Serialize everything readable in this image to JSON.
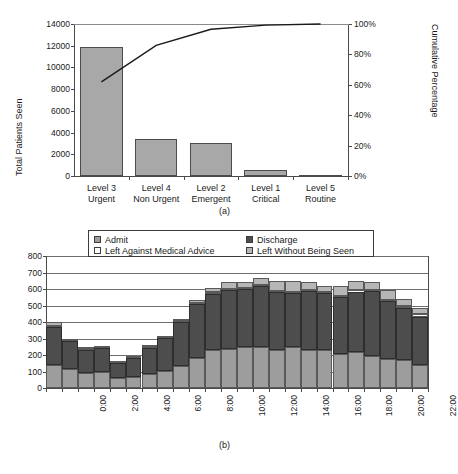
{
  "figure_a": {
    "caption": "(a)",
    "ylabel_left": "Total Patients Seen",
    "ylabel_right": "Cumulative Percentage",
    "y_left_ticks": [
      "0",
      "2000",
      "4000",
      "6000",
      "8000",
      "10000",
      "12000",
      "14000"
    ],
    "y_right_ticks": [
      "0%",
      "20%",
      "40%",
      "60%",
      "80%",
      "100%"
    ],
    "categories": [
      {
        "line1": "Level 3",
        "line2": "Urgent"
      },
      {
        "line1": "Level 4",
        "line2": "Non Urgent"
      },
      {
        "line1": "Level 2",
        "line2": "Emergent"
      },
      {
        "line1": "Level 1",
        "line2": "Critical"
      },
      {
        "line1": "Level 5",
        "line2": "Routine"
      }
    ]
  },
  "figure_b": {
    "caption": "(b)",
    "y_ticks": [
      "0",
      "100",
      "200",
      "300",
      "400",
      "500",
      "600",
      "700",
      "800"
    ],
    "x_ticks": [
      "0:00",
      "2:00",
      "4:00",
      "6:00",
      "8:00",
      "10:00",
      "12:00",
      "14:00",
      "16:00",
      "18:00",
      "20:00",
      "22:00"
    ],
    "legend": [
      {
        "label": "Admit",
        "swatch": "admit"
      },
      {
        "label": "Discharge",
        "swatch": "disch"
      },
      {
        "label": "Left Against Medical Advice",
        "swatch": "lama"
      },
      {
        "label": "Left Without Being Seen",
        "swatch": "lwbs"
      }
    ]
  },
  "colors": {
    "bar_fill": "#a8a8a8",
    "bar_stroke": "#4c4c4c",
    "admit": "#9d9d9d",
    "discharge": "#4d4d4d",
    "lama": "#ffffff",
    "lwbs": "#b6b6b6",
    "axis": "#4a4a4a",
    "grid": "#6e6e6e",
    "line": "#1a1a1a"
  },
  "chart_data": [
    {
      "type": "bar",
      "id": "pareto-triage",
      "title": "",
      "xlabel": "",
      "ylabel": "Total Patients Seen",
      "ylabel_secondary": "Cumulative Percentage",
      "ylim": [
        0,
        14000
      ],
      "ylim_secondary": [
        0,
        100
      ],
      "grid": false,
      "legend": "none",
      "categories": [
        "Level 3 Urgent",
        "Level 4 Non Urgent",
        "Level 2 Emergent",
        "Level 1 Critical",
        "Level 5 Routine"
      ],
      "values": [
        11900,
        3430,
        3030,
        550,
        100
      ],
      "series": [
        {
          "name": "Total Patients Seen",
          "type": "bar",
          "values": [
            11900,
            3430,
            3030,
            550,
            100
          ]
        },
        {
          "name": "Cumulative Percentage",
          "type": "line",
          "axis": "secondary",
          "values": [
            62,
            86,
            96.5,
            99.3,
            100
          ]
        }
      ],
      "yticks": [
        0,
        2000,
        4000,
        6000,
        8000,
        10000,
        12000,
        14000
      ],
      "yticks_secondary": [
        0,
        20,
        40,
        60,
        80,
        100
      ]
    },
    {
      "type": "bar",
      "id": "hourly-disposition",
      "subtype": "stacked",
      "title": "",
      "xlabel": "",
      "ylabel": "",
      "ylim": [
        0,
        800
      ],
      "grid": true,
      "legend": "top-inside",
      "categories": [
        "0:00",
        "1:00",
        "2:00",
        "3:00",
        "4:00",
        "5:00",
        "6:00",
        "7:00",
        "8:00",
        "9:00",
        "10:00",
        "11:00",
        "12:00",
        "13:00",
        "14:00",
        "15:00",
        "16:00",
        "17:00",
        "18:00",
        "19:00",
        "20:00",
        "21:00",
        "22:00",
        "23:00"
      ],
      "xticklabels": [
        "0:00",
        "",
        "2:00",
        "",
        "4:00",
        "",
        "6:00",
        "",
        "8:00",
        "",
        "10:00",
        "",
        "12:00",
        "",
        "14:00",
        "",
        "16:00",
        "",
        "18:00",
        "",
        "20:00",
        "",
        "22:00",
        ""
      ],
      "yticks": [
        0,
        100,
        200,
        300,
        400,
        500,
        600,
        700,
        800
      ],
      "series": [
        {
          "name": "Admit",
          "values": [
            137,
            115,
            93,
            99,
            58,
            67,
            82,
            104,
            134,
            180,
            231,
            234,
            248,
            249,
            231,
            247,
            233,
            231,
            209,
            219,
            195,
            176,
            172,
            141
          ]
        },
        {
          "name": "Discharge",
          "values": [
            233,
            168,
            137,
            142,
            93,
            113,
            163,
            198,
            267,
            327,
            339,
            360,
            350,
            368,
            349,
            328,
            352,
            343,
            343,
            366,
            392,
            352,
            315,
            292
          ]
        },
        {
          "name": "Left Against Medical Advice",
          "values": [
            8,
            4,
            6,
            2,
            2,
            3,
            3,
            3,
            4,
            6,
            10,
            8,
            8,
            7,
            6,
            6,
            7,
            6,
            7,
            6,
            8,
            8,
            10,
            14
          ]
        },
        {
          "name": "Left Without Being Seen",
          "values": [
            22,
            6,
            14,
            0,
            0,
            0,
            2,
            0,
            7,
            21,
            24,
            38,
            34,
            45,
            62,
            69,
            49,
            37,
            60,
            59,
            49,
            57,
            42,
            36
          ]
        }
      ],
      "totals": [
        400,
        293,
        250,
        243,
        153,
        183,
        250,
        305,
        412,
        534,
        604,
        640,
        640,
        669,
        648,
        650,
        641,
        617,
        619,
        650,
        644,
        593,
        539,
        483
      ]
    }
  ]
}
